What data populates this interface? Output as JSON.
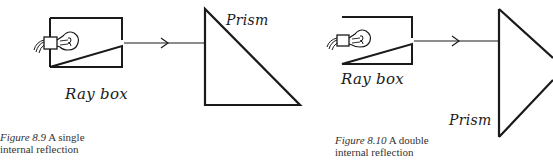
{
  "colors": {
    "ink": "#1a1a1a",
    "caption_text": "#333333",
    "background": "#ffffff"
  },
  "figures": [
    {
      "id": "figure-8-9",
      "ray_box_label": "Ray box",
      "prism_label": "Prism",
      "caption": {
        "number": "Figure 8.9",
        "text_line1": "A single",
        "text_line2": "internal reflection"
      },
      "prism_shape": "right-angled triangle"
    },
    {
      "id": "figure-8-10",
      "ray_box_label": "Ray box",
      "prism_label": "Prism",
      "caption": {
        "number": "Figure 8.10",
        "text_line1": "A double",
        "text_line2": "internal reflection"
      },
      "prism_shape": "triangle (apex right, cropped)"
    }
  ],
  "icons": {
    "bulb": "light-bulb-icon",
    "arrow": "ray-arrow-icon"
  }
}
